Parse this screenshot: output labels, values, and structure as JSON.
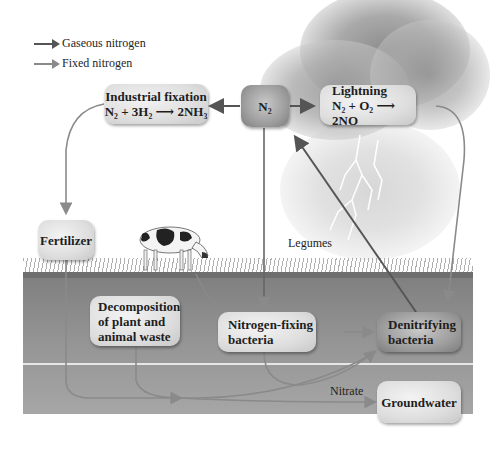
{
  "legend": [
    {
      "label": "Gaseous nitrogen",
      "color": "#555555"
    },
    {
      "label": "Fixed nitrogen",
      "color": "#8a8a8a"
    }
  ],
  "nodes": {
    "industrial_fixation": {
      "title": "Industrial fixation",
      "equation": "N₂ + 3H₂ ⟶ 2NH₃"
    },
    "n2": {
      "title": "N₂"
    },
    "lightning": {
      "title": "Lightning",
      "equation": "N₂ + O₂ ⟶ 2NO"
    },
    "fertilizer": {
      "title": "Fertilizer"
    },
    "decomposition": {
      "line1": "Decomposition",
      "line2": "of plant and",
      "line3": "animal waste"
    },
    "nitrogen_fixing": {
      "line1": "Nitrogen-fixing",
      "line2": "bacteria"
    },
    "denitrifying": {
      "line1": "Denitrifying",
      "line2": "bacteria"
    },
    "groundwater": {
      "title": "Groundwater"
    }
  },
  "labels": {
    "legumes": "Legumes",
    "nitrate": "Nitrate"
  },
  "colors": {
    "gaseous_arrow": "#555555",
    "fixed_arrow": "#8a8a8a",
    "soil": "#8f8f8f"
  }
}
